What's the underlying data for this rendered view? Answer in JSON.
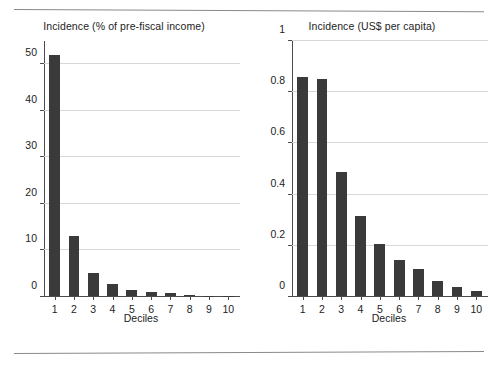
{
  "figure": {
    "background": "#ffffff",
    "bar_color": "#3a3a3a",
    "grid_color": "#d8d8d8",
    "axis_color": "#4a4a4a",
    "top_rule": "horizontal-rule",
    "bottom_rule": "horizontal-rule"
  },
  "chart_data": [
    {
      "type": "bar",
      "title": "Incidence (% of pre-fiscal income)",
      "xlabel": "Deciles",
      "ylabel": "",
      "categories": [
        "1",
        "2",
        "3",
        "4",
        "5",
        "6",
        "7",
        "8",
        "9",
        "10"
      ],
      "values": [
        52,
        13,
        5,
        2.5,
        1.4,
        0.9,
        0.6,
        0.25,
        0.1,
        0.05
      ],
      "ylim": [
        0,
        55
      ],
      "yticks": [
        0,
        10,
        20,
        30,
        40,
        50
      ],
      "ytick_labels": [
        "0",
        "10",
        "20",
        "30",
        "40",
        "50"
      ],
      "grid": true,
      "legend": "none"
    },
    {
      "type": "bar",
      "title": "Incidence (US$ per capita)",
      "xlabel": "Deciles",
      "ylabel": "",
      "categories": [
        "1",
        "2",
        "3",
        "4",
        "5",
        "6",
        "7",
        "8",
        "9",
        "10"
      ],
      "values": [
        0.86,
        0.85,
        0.485,
        0.315,
        0.205,
        0.14,
        0.105,
        0.06,
        0.035,
        0.02
      ],
      "ylim": [
        0,
        1
      ],
      "yticks": [
        0,
        0.2,
        0.4,
        0.6,
        0.8,
        1
      ],
      "ytick_labels": [
        "0",
        "0.2",
        "0.4",
        "0.6",
        "0.8",
        "1"
      ],
      "grid": true,
      "legend": "none"
    }
  ]
}
